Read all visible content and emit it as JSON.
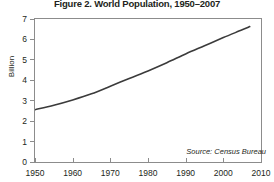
{
  "chart_data": {
    "type": "line",
    "title": "Figure 2. World Population, 1950–2007",
    "xlabel": "",
    "ylabel": "Billion",
    "xlim": [
      1950,
      2010
    ],
    "ylim": [
      0,
      7
    ],
    "grid": false,
    "legend": "none",
    "source": "Source: Census Bureau",
    "xticks": [
      1950,
      1960,
      1970,
      1980,
      1990,
      2000,
      2010
    ],
    "xticklabels": [
      "1950",
      "1960",
      "1970",
      "1980",
      "1990",
      "2000",
      "2010"
    ],
    "yticks": [
      0,
      1,
      2,
      3,
      4,
      5,
      6,
      7
    ],
    "yticklabels": [
      "0",
      "1",
      "2",
      "3",
      "4",
      "5",
      "6",
      "7"
    ],
    "line_color": "#3b3b3b",
    "x": [
      1950,
      1955,
      1960,
      1965,
      1970,
      1975,
      1980,
      1985,
      1990,
      1995,
      2000,
      2005,
      2007
    ],
    "values": [
      2.56,
      2.78,
      3.04,
      3.34,
      3.71,
      4.09,
      4.46,
      4.86,
      5.29,
      5.69,
      6.09,
      6.47,
      6.63
    ],
    "series": [
      {
        "name": "World population",
        "values": [
          2.56,
          2.78,
          3.04,
          3.34,
          3.71,
          4.09,
          4.46,
          4.86,
          5.29,
          5.69,
          6.09,
          6.47,
          6.63
        ]
      }
    ]
  }
}
